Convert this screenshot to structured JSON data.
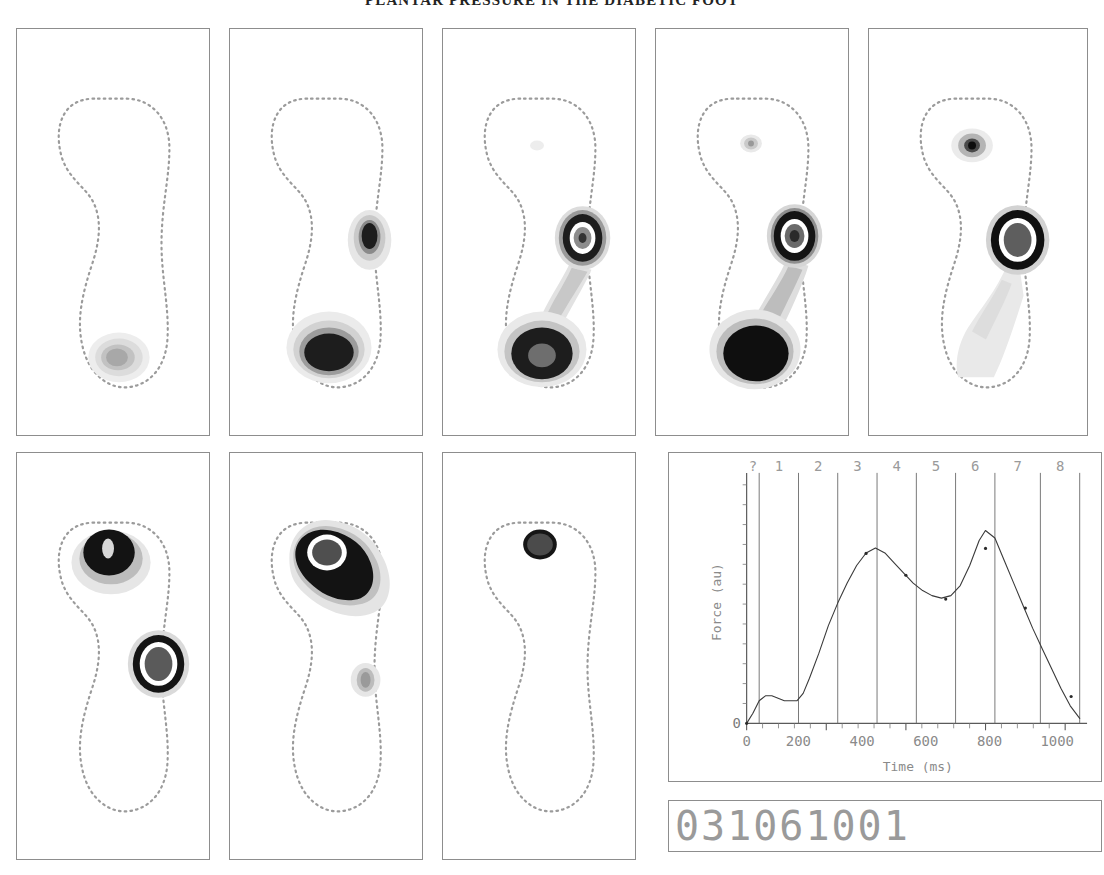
{
  "header": {
    "running_title": "PLANTAR PRESSURE IN THE DIABETIC FOOT"
  },
  "figure": {
    "id_label": "031061001",
    "panel_count": 8,
    "panels": [
      {
        "name": "panel-1",
        "phase": "1",
        "description": "initial heel contact, low pressure at heel"
      },
      {
        "name": "panel-2",
        "phase": "2",
        "description": "heel load plus lateral metatarsal peak"
      },
      {
        "name": "panel-3",
        "phase": "3",
        "description": "heel peak and metatarsal ring contour"
      },
      {
        "name": "panel-4",
        "phase": "4",
        "description": "full heel load with midfoot bridge"
      },
      {
        "name": "panel-5",
        "phase": "5",
        "description": "heel unloading, metatarsal peak, hallux onset"
      },
      {
        "name": "panel-6",
        "phase": "6",
        "description": "forefoot and hallux loading"
      },
      {
        "name": "panel-7",
        "phase": "7",
        "description": "hallux peak merging with forefoot"
      },
      {
        "name": "panel-8",
        "phase": "8",
        "description": "toe off, isolated hallux pressure"
      }
    ],
    "pressure_scale": {
      "level_0": "#ffffff",
      "level_1": "#e4e4e4",
      "level_2": "#c6c6c6",
      "level_3": "#a2a2a2",
      "level_4": "#6e6e6e",
      "level_5": "#3a3a3a",
      "level_6": "#141414",
      "peak_ring": "#ffffff",
      "outline": "#9b9b9b"
    }
  },
  "chart_data": {
    "type": "line",
    "title": "",
    "xlabel": "Time (ms)",
    "ylabel": "Force (au)",
    "xlim": [
      0,
      1060
    ],
    "ylim": [
      0,
      100
    ],
    "xticks": [
      0,
      200,
      400,
      600,
      800,
      1000
    ],
    "xticklabels": [
      "0",
      "200",
      "400",
      "600",
      "800",
      "1000"
    ],
    "yticks": [
      0
    ],
    "yticklabels": [
      "0"
    ],
    "grid": false,
    "legend": null,
    "phase_labels": [
      "?",
      "1",
      "2",
      "3",
      "4",
      "5",
      "6",
      "7",
      "8"
    ],
    "phase_boundaries": [
      40,
      165,
      290,
      415,
      540,
      665,
      790,
      935,
      1060
    ],
    "series": [
      {
        "name": "vertical ground reaction force",
        "x": [
          0,
          20,
          40,
          60,
          80,
          100,
          120,
          140,
          160,
          180,
          200,
          230,
          260,
          290,
          320,
          350,
          380,
          410,
          440,
          470,
          500,
          530,
          560,
          590,
          620,
          650,
          680,
          710,
          740,
          760,
          790,
          820,
          850,
          880,
          910,
          940,
          970,
          1000,
          1030,
          1060
        ],
        "y": [
          0,
          4,
          9,
          11,
          11,
          10,
          9,
          9,
          9,
          12,
          18,
          28,
          39,
          48,
          56,
          63,
          68,
          70,
          68,
          64,
          60,
          56,
          53,
          51,
          50,
          51,
          55,
          63,
          73,
          77,
          74,
          65,
          56,
          47,
          38,
          30,
          22,
          14,
          7,
          2
        ]
      }
    ],
    "annotations": [
      {
        "label": "first peak",
        "x": 410,
        "y": 70
      },
      {
        "label": "midstance trough",
        "x": 620,
        "y": 50
      },
      {
        "label": "second peak",
        "x": 760,
        "y": 77
      }
    ]
  }
}
